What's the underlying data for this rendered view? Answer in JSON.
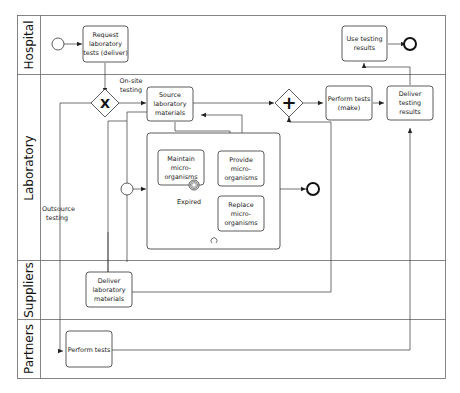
{
  "diagram": {
    "type": "BPMN process diagram",
    "lanes": [
      {
        "id": "hospital",
        "label": "Hospital"
      },
      {
        "id": "laboratory",
        "label": "Laboratory"
      },
      {
        "id": "suppliers",
        "label": "Suppliers"
      },
      {
        "id": "partners",
        "label": "Partners"
      }
    ],
    "tasks": {
      "request_tests": [
        "Request",
        "laboratory",
        "tests (deliver)"
      ],
      "use_results": [
        "Use testing",
        "results"
      ],
      "source_materials": [
        "Source",
        "laboratory",
        "materials"
      ],
      "perform_tests_make": [
        "Perform tests",
        "(make)"
      ],
      "deliver_results": [
        "Deliver",
        "testing",
        "results"
      ],
      "maintain": [
        "Maintain",
        "micro-",
        "organisms"
      ],
      "provide": [
        "Provide",
        "micro-",
        "organisms"
      ],
      "replace": [
        "Replace",
        "micro-",
        "organisms"
      ],
      "deliver_materials": [
        "Deliver",
        "laboratory",
        "materials"
      ],
      "perform_tests_partner": [
        "Perform tests"
      ]
    },
    "gateways": {
      "exclusive": "X",
      "parallel": "+"
    },
    "labels": {
      "onsite": [
        "On-site",
        "testing"
      ],
      "outsource": [
        "Outsource",
        "testing"
      ],
      "expired": "Expired"
    },
    "colors": {
      "line": "#333333",
      "lane_border": "#555555",
      "fill": "#ffffff"
    }
  }
}
